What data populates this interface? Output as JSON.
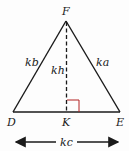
{
  "diagram": {
    "vertices": {
      "F": {
        "label": "F",
        "x": 66,
        "y": 21
      },
      "D": {
        "label": "D",
        "x": 13,
        "y": 112
      },
      "E": {
        "label": "E",
        "x": 120,
        "y": 112
      },
      "K": {
        "label": "K",
        "x": 67,
        "y": 112
      }
    },
    "sides": {
      "DF": "kb",
      "FE": "ka",
      "FK": "kh",
      "DE": "kc"
    },
    "colors": {
      "line": "#1a1a1a",
      "right_angle_marker": "#b22222"
    }
  }
}
